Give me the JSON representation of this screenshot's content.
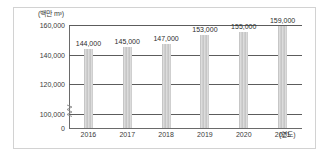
{
  "chart_data": {
    "type": "bar",
    "title": "",
    "subtitle": "",
    "xlabel": "(연도)",
    "ylabel": "(백만 m³)",
    "categories": [
      "2016",
      "2017",
      "2018",
      "2019",
      "2020",
      "2021"
    ],
    "values": [
      144000,
      145000,
      147000,
      153000,
      155000,
      159000
    ],
    "value_labels": [
      "144,000",
      "145,000",
      "147,000",
      "153,000",
      "155,000",
      "159,000"
    ],
    "series": [
      {
        "name": "",
        "values": [
          144000,
          145000,
          147000,
          153000,
          155000,
          159000
        ]
      }
    ],
    "ylim": [
      0,
      160000
    ],
    "yticks": [
      0,
      100000,
      120000,
      140000,
      160000
    ],
    "ytick_labels": [
      "0",
      "100,000",
      "120,000",
      "140,000",
      "160,000"
    ],
    "grid": true,
    "grid_axis": "y",
    "legend": false,
    "legend_position": "none",
    "axis_break": true,
    "axis_break_between": [
      0,
      100000
    ],
    "bar_color": "#d3d3d3",
    "bar_pattern": "vertical-stripes",
    "gridline_color": "#5c5c5c",
    "frame_color": "#d2d2d2",
    "background_color": "#ffffff",
    "text_color": "#3a3a3a"
  },
  "icons": {
    "axis_break": "axis-break-zigzag"
  }
}
